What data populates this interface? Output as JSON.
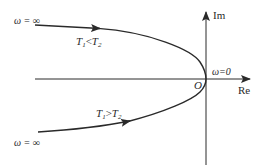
{
  "diagram": {
    "type": "nyquist-plot",
    "axes": {
      "imag_label": "Im",
      "real_label": "Re",
      "origin_label": "O"
    },
    "annotations": {
      "omega_zero": "ω=0",
      "omega_inf_top": "ω = ∞",
      "omega_inf_bottom": "ω = ∞"
    },
    "curves": [
      {
        "name": "upper",
        "condition": {
          "t1": "T",
          "sub1": "1",
          "op": "<",
          "t2": "T",
          "sub2": "2"
        },
        "direction": "from ω=∞ (left) toward origin"
      },
      {
        "name": "lower",
        "condition": {
          "t1": "T",
          "sub1": "1",
          "op": ">",
          "t2": "T",
          "sub2": "2"
        },
        "direction": "from ω=∞ (left) toward origin"
      }
    ],
    "colors": {
      "stroke": "#2a2a2a",
      "background": "#ffffff"
    }
  }
}
